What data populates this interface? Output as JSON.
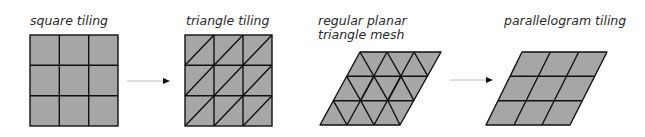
{
  "labels": {
    "square": "square tiling",
    "triangle": "triangle tiling",
    "mesh_line1": "regular planar",
    "mesh_line2": "triangle mesh",
    "parallelogram": "parallelogram tiling"
  },
  "colors": {
    "fill": "#a6a6a6",
    "stroke": "#111111",
    "arrow": "#c8c8c8"
  },
  "diagram": {
    "panels": [
      {
        "id": "square-tiling",
        "grid": "3x3",
        "shape": "square"
      },
      {
        "id": "triangle-tiling",
        "grid": "3x3",
        "shape": "square split by diagonals"
      },
      {
        "id": "regular-planar-triangle-mesh",
        "grid": "3x3",
        "shape": "parallelogram of equilateral triangles"
      },
      {
        "id": "parallelogram-tiling",
        "grid": "3x3",
        "shape": "parallelogram"
      }
    ],
    "arrows": [
      {
        "from": "square-tiling",
        "to": "triangle-tiling"
      },
      {
        "from": "regular-planar-triangle-mesh",
        "to": "parallelogram-tiling"
      }
    ]
  }
}
